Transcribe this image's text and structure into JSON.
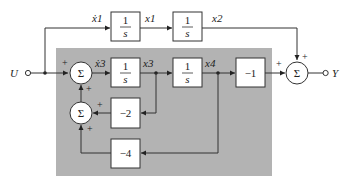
{
  "diagram": {
    "type": "block-diagram",
    "input": {
      "label": "U"
    },
    "output": {
      "label": "Y"
    },
    "highlight_region_color": "#b3b3b3",
    "signals": {
      "x1dot": "ẋ1",
      "x1": "x1",
      "x2": "x2",
      "x3dot": "ẋ3",
      "x3": "x3",
      "x4": "x4"
    },
    "blocks": {
      "int1_num": "1",
      "int1_den": "s",
      "int2_num": "1",
      "int2_den": "s",
      "int3_num": "1",
      "int3_den": "s",
      "int4_num": "1",
      "int4_den": "s",
      "gain_neg1": "−1",
      "gain_neg2": "−2",
      "gain_neg4": "−4"
    },
    "summers": {
      "symbol": "Σ",
      "plus": "+"
    }
  }
}
